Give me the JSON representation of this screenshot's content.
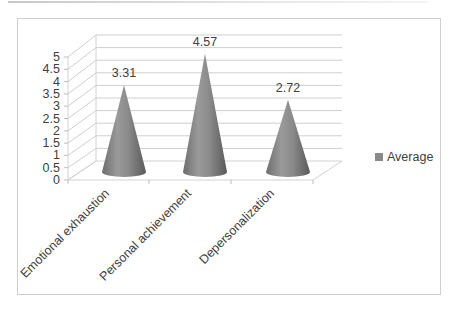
{
  "chart_data": {
    "type": "bar",
    "subtype": "3d-cone",
    "title": "",
    "xlabel": "",
    "ylabel": "",
    "categories": [
      "Emotional exhaustion",
      "Personal achievement",
      "Depersonalization"
    ],
    "series": [
      {
        "name": "Average",
        "values": [
          3.31,
          4.57,
          2.72
        ],
        "color": "#8a8a8a"
      }
    ],
    "data_labels": [
      "3.31",
      "4.57",
      "2.72"
    ],
    "yticks": [
      "0",
      "0.5",
      "1",
      "1.5",
      "2",
      "2.5",
      "3",
      "3.5",
      "4",
      "4.5",
      "5"
    ],
    "ylim": [
      0,
      5
    ],
    "grid": true,
    "legend_position": "right"
  },
  "legend": {
    "label": "Average"
  }
}
